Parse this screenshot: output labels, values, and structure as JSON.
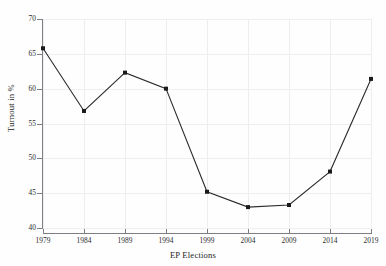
{
  "chart_data": {
    "type": "line",
    "title": "",
    "xlabel": "EP Elections",
    "ylabel": "Turnout in %",
    "categories": [
      "1979",
      "1984",
      "1989",
      "1994",
      "1999",
      "2004",
      "2009",
      "2014",
      "2019"
    ],
    "values": [
      65.8,
      56.8,
      62.3,
      60.0,
      45.2,
      43.0,
      43.3,
      48.1,
      61.4
    ],
    "series": [
      {
        "name": "Turnout",
        "values": [
          65.8,
          56.8,
          62.3,
          60.0,
          45.2,
          43.0,
          43.3,
          48.1,
          61.4
        ]
      }
    ],
    "ylim": [
      40,
      70
    ],
    "ytick_labels": [
      "40",
      "45",
      "50",
      "55",
      "60",
      "65",
      "70"
    ],
    "ytick_values": [
      40,
      45,
      50,
      55,
      60,
      65,
      70
    ],
    "xtick_labels": [
      "1979",
      "1984",
      "1989",
      "1994",
      "1999",
      "2004",
      "2009",
      "2014",
      "2019"
    ],
    "grid": true,
    "legend": "none",
    "marker": "filled-square",
    "line_color": "#2b2b2b",
    "marker_color": "#1a1a1a",
    "grid_color": "#eeeef0",
    "axis_color": "#7e7e84",
    "background_color": "#fefefe"
  },
  "axes": {
    "y_title": "Turnout in %",
    "x_title": "EP Elections"
  },
  "ticks": {
    "y": [
      {
        "label": "70",
        "value": 70
      },
      {
        "label": "65",
        "value": 65
      },
      {
        "label": "60",
        "value": 60
      },
      {
        "label": "55",
        "value": 55
      },
      {
        "label": "50",
        "value": 50
      },
      {
        "label": "45",
        "value": 45
      },
      {
        "label": "40",
        "value": 40
      }
    ],
    "x": [
      {
        "label": "1979"
      },
      {
        "label": "1984"
      },
      {
        "label": "1989"
      },
      {
        "label": "1994"
      },
      {
        "label": "1999"
      },
      {
        "label": "2004"
      },
      {
        "label": "2009"
      },
      {
        "label": "2014"
      },
      {
        "label": "2019"
      }
    ]
  }
}
